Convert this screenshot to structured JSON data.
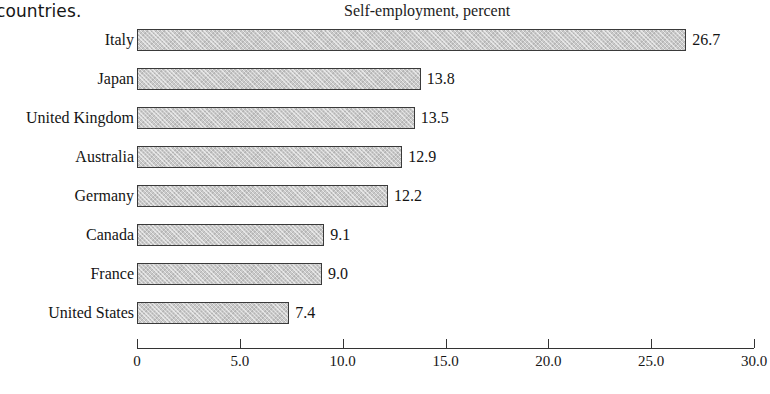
{
  "caption_fragment": "countries.",
  "footer_fragment": "",
  "chart_data": {
    "type": "bar",
    "orientation": "horizontal",
    "title": "Self-employment, percent",
    "xlabel": "",
    "ylabel": "",
    "categories": [
      "Italy",
      "Japan",
      "United Kingdom",
      "Australia",
      "Germany",
      "Canada",
      "France",
      "United States"
    ],
    "values": [
      26.7,
      13.8,
      13.5,
      12.9,
      12.2,
      9.1,
      9.0,
      7.4
    ],
    "value_labels": [
      "26.7",
      "13.8",
      "13.5",
      "12.9",
      "12.2",
      "9.1",
      "9.0",
      "7.4"
    ],
    "xlim": [
      0,
      30
    ],
    "xticks": [
      0,
      5,
      10,
      15,
      20,
      25,
      30
    ],
    "xtick_labels": [
      "0",
      "5.0",
      "10.0",
      "15.0",
      "20.0",
      "25.0",
      "30.0"
    ],
    "grid": false,
    "legend": false,
    "bar_fill_color": "#c9c9c9",
    "bar_edge_color": "#3a3a3a",
    "text_color": "#141414",
    "background_color": "#ffffff"
  }
}
